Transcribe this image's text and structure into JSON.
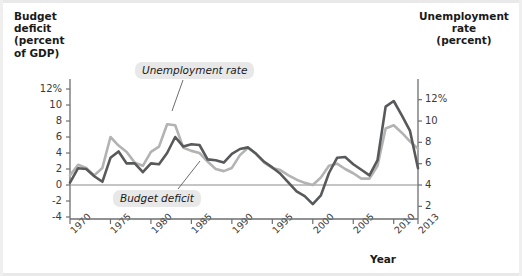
{
  "axes": {
    "left_title": "Budget deficit (percent of GDP)",
    "left_title_lines": [
      "Budget",
      "deficit",
      "(percent",
      "of GDP)"
    ],
    "right_title": "Unemployment rate (percent)",
    "right_title_lines": [
      "Unemployment",
      "rate",
      "(percent)"
    ],
    "x_title": "Year",
    "left_ticks": [
      "12%",
      "10",
      "8",
      "6",
      "4",
      "2",
      "0",
      "-2",
      "-4"
    ],
    "right_ticks": [
      "12%",
      "10",
      "8",
      "6",
      "4",
      "2"
    ],
    "x_ticks": [
      "1970",
      "1975",
      "1980",
      "1985",
      "1990",
      "1995",
      "2000",
      "2005",
      "2010",
      "2013"
    ]
  },
  "labels": {
    "unemployment": "Unemployment rate",
    "deficit": "Budget deficit"
  },
  "colors": {
    "deficit_line": "#58595b",
    "unemployment_line": "#b3b3b3",
    "axis": "#6d6e71",
    "callout_bg": "#e8e8e8",
    "background": "#ffffff"
  },
  "chart_data": {
    "type": "line",
    "title": "",
    "xlabel": "Year",
    "ylabel": "Budget deficit (percent of GDP)",
    "y2label": "Unemployment rate (percent)",
    "xlim": [
      1970,
      2013
    ],
    "ylim": [
      -4,
      12
    ],
    "y2lim": [
      1,
      13
    ],
    "grid": false,
    "legend": "annotations",
    "x": [
      1970,
      1971,
      1972,
      1973,
      1974,
      1975,
      1976,
      1977,
      1978,
      1979,
      1980,
      1981,
      1982,
      1983,
      1984,
      1985,
      1986,
      1987,
      1988,
      1989,
      1990,
      1991,
      1992,
      1993,
      1994,
      1995,
      1996,
      1997,
      1998,
      1999,
      2000,
      2001,
      2002,
      2003,
      2004,
      2005,
      2006,
      2007,
      2008,
      2009,
      2010,
      2011,
      2012,
      2013
    ],
    "series": [
      {
        "name": "Budget deficit",
        "axis": "left",
        "units": "percent of GDP",
        "values": [
          0.3,
          2.1,
          2.0,
          1.1,
          0.4,
          3.4,
          4.2,
          2.7,
          2.7,
          1.6,
          2.7,
          2.6,
          4.0,
          6.0,
          4.8,
          5.1,
          5.0,
          3.2,
          3.1,
          2.8,
          3.9,
          4.5,
          4.7,
          3.9,
          2.9,
          2.2,
          1.4,
          0.3,
          -0.8,
          -1.4,
          -2.4,
          -1.3,
          1.5,
          3.4,
          3.5,
          2.6,
          1.9,
          1.2,
          3.1,
          9.8,
          10.5,
          8.7,
          6.8,
          2.1
        ]
      },
      {
        "name": "Unemployment rate",
        "axis": "right",
        "units": "percent",
        "values": [
          4.9,
          5.9,
          5.6,
          4.9,
          5.6,
          8.5,
          7.7,
          7.1,
          6.1,
          5.8,
          7.1,
          7.6,
          9.7,
          9.6,
          7.5,
          7.2,
          7.0,
          6.2,
          5.5,
          5.3,
          5.6,
          6.8,
          7.5,
          6.9,
          6.1,
          5.6,
          5.4,
          4.9,
          4.5,
          4.2,
          4.0,
          4.7,
          5.8,
          6.0,
          5.5,
          5.1,
          4.6,
          4.6,
          5.8,
          9.3,
          9.6,
          8.9,
          8.1,
          7.4
        ]
      }
    ]
  }
}
